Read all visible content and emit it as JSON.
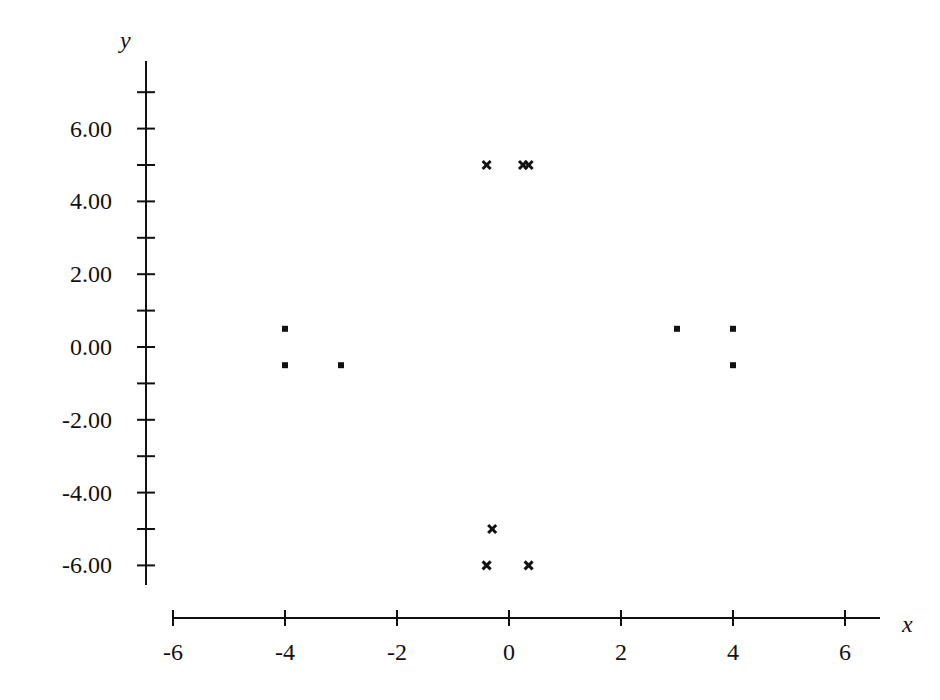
{
  "chart_data": {
    "type": "scatter",
    "title": "",
    "xlabel": "x",
    "ylabel": "y",
    "xlim": [
      -6,
      6.6
    ],
    "ylim": [
      -6.6,
      7.8
    ],
    "grid": false,
    "legend": null,
    "x_ticks": [
      -6,
      -4,
      -2,
      0,
      2,
      4,
      6
    ],
    "x_tick_labels": [
      "-6",
      "-4",
      "-2",
      "0",
      "2",
      "4",
      "6"
    ],
    "y_ticks_minor": [
      7,
      6,
      5,
      4,
      3,
      2,
      1,
      0,
      -1,
      -2,
      -3,
      -4,
      -5,
      -6
    ],
    "y_ticks": [
      6,
      4,
      2,
      0,
      -2,
      -4,
      -6
    ],
    "y_tick_labels": [
      "6.00",
      "4.00",
      "2.00",
      "0.00",
      "-2.00",
      "-4.00",
      "-6.00"
    ],
    "series": [
      {
        "name": "crosses",
        "marker": "x",
        "color": "#111111",
        "points": [
          {
            "x": -0.4,
            "y": 5.0
          },
          {
            "x": 0.25,
            "y": 5.0
          },
          {
            "x": 0.35,
            "y": 5.0
          },
          {
            "x": -0.3,
            "y": -5.0
          },
          {
            "x": -0.4,
            "y": -6.0
          },
          {
            "x": 0.35,
            "y": -6.0
          }
        ]
      },
      {
        "name": "squares",
        "marker": "square",
        "color": "#111111",
        "points": [
          {
            "x": -4.0,
            "y": 0.5
          },
          {
            "x": -4.0,
            "y": -0.5
          },
          {
            "x": -3.0,
            "y": -0.5
          },
          {
            "x": 3.0,
            "y": 0.5
          },
          {
            "x": 4.0,
            "y": 0.5
          },
          {
            "x": 4.0,
            "y": -0.5
          }
        ]
      }
    ]
  }
}
